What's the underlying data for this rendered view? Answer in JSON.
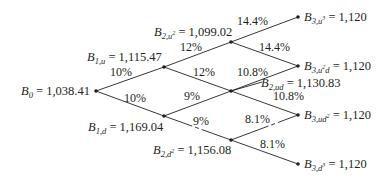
{
  "diagram": {
    "type": "binomial-bond-price-tree",
    "colors": {
      "line": "#231f20",
      "text": "#231f20",
      "background": "#ffffff"
    },
    "nodes": {
      "b0": {
        "sym": "B",
        "sub": "0",
        "sup": "",
        "eq": " = 1,038.41"
      },
      "b1u": {
        "sym": "B",
        "sub": "1,u",
        "sup": "",
        "eq": " = 1,115.47"
      },
      "b1d": {
        "sym": "B",
        "sub": "1,d",
        "sup": "",
        "eq": " = 1,169.04"
      },
      "b2uu": {
        "sym": "B",
        "sub": "2,u",
        "sup": "2",
        "eq": " = 1,099.02"
      },
      "b2ud": {
        "sym": "B",
        "sub": "2,ud",
        "sup": "",
        "eq": " = 1,130.83"
      },
      "b2dd": {
        "sym": "B",
        "sub": "2,d",
        "sup": "2",
        "eq": " = 1,156.08"
      },
      "b3uuu": {
        "sym": "B",
        "sub": "3,u",
        "sup": "3",
        "eq": " = 1,120"
      },
      "b3uud": {
        "sym": "B",
        "sub": "3,u",
        "sup": "2",
        "sub2": "d",
        "eq": " = 1,120"
      },
      "b3udd": {
        "sym": "B",
        "sub": "3,ud",
        "sup": "2",
        "eq": " = 1,120"
      },
      "b3ddd": {
        "sym": "B",
        "sub": "3,d",
        "sup": "3",
        "eq": " = 1,120"
      }
    },
    "rates": {
      "b0_b1u": "10%",
      "b0_b1d": "10%",
      "b1u_b2uu": "12%",
      "b1u_b2ud": "12%",
      "b1d_b2ud": "9%",
      "b1d_b2dd": "9%",
      "b2uu_b3uuu": "14.4%",
      "b2uu_b3uud": "14.4%",
      "b2ud_b3uud": "10.8%",
      "b2ud_b3udd": "10.8%",
      "b2dd_b3udd": "8.1%",
      "b2dd_b3ddd": "8.1%"
    }
  }
}
